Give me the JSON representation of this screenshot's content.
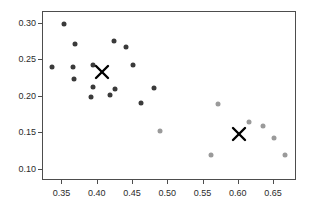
{
  "chart_data": {
    "type": "scatter",
    "title": "",
    "xlabel": "",
    "ylabel": "",
    "xlim": [
      0.3225,
      0.6825
    ],
    "ylim": [
      0.0845,
      0.3165
    ],
    "grid": false,
    "legend_position": "none",
    "x_ticks": [
      0.35,
      0.4,
      0.45,
      0.5,
      0.55,
      0.6,
      0.65
    ],
    "x_tick_labels": [
      "0.35",
      "0.40",
      "0.45",
      "0.50",
      "0.55",
      "0.60",
      "0.65"
    ],
    "y_ticks": [
      0.1,
      0.15,
      0.2,
      0.25,
      0.3
    ],
    "y_tick_labels": [
      "0.10",
      "0.15",
      "0.20",
      "0.25",
      "0.30"
    ],
    "series": [
      {
        "name": "group-a",
        "marker": "circle",
        "color": "#3a3a3a",
        "points": [
          {
            "x": 0.352,
            "y": 0.3
          },
          {
            "x": 0.368,
            "y": 0.272
          },
          {
            "x": 0.423,
            "y": 0.277
          },
          {
            "x": 0.44,
            "y": 0.269
          },
          {
            "x": 0.335,
            "y": 0.241
          },
          {
            "x": 0.365,
            "y": 0.241
          },
          {
            "x": 0.393,
            "y": 0.244
          },
          {
            "x": 0.45,
            "y": 0.244
          },
          {
            "x": 0.366,
            "y": 0.225
          },
          {
            "x": 0.394,
            "y": 0.214
          },
          {
            "x": 0.424,
            "y": 0.211
          },
          {
            "x": 0.48,
            "y": 0.212
          },
          {
            "x": 0.418,
            "y": 0.203
          },
          {
            "x": 0.391,
            "y": 0.2
          },
          {
            "x": 0.461,
            "y": 0.191
          }
        ]
      },
      {
        "name": "group-b",
        "marker": "circle",
        "color": "#9a9a9a",
        "points": [
          {
            "x": 0.57,
            "y": 0.19
          },
          {
            "x": 0.489,
            "y": 0.153
          },
          {
            "x": 0.614,
            "y": 0.166
          },
          {
            "x": 0.634,
            "y": 0.16
          },
          {
            "x": 0.65,
            "y": 0.143
          },
          {
            "x": 0.56,
            "y": 0.12
          },
          {
            "x": 0.666,
            "y": 0.12
          }
        ]
      }
    ],
    "centroids": [
      {
        "name": "centroid-a",
        "x": 0.406,
        "y": 0.234,
        "marker": "x",
        "color": "#000000"
      },
      {
        "name": "centroid-b",
        "x": 0.6,
        "y": 0.149,
        "marker": "x",
        "color": "#000000"
      }
    ]
  }
}
